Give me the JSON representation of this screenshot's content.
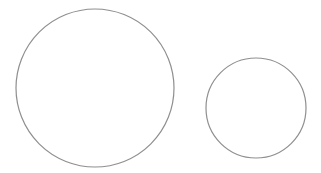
{
  "diagram": {
    "stroke_color": "#8f8f8f",
    "background_color": "#ffffff",
    "shapes": [
      {
        "id": "large-circle",
        "kind": "circle"
      },
      {
        "id": "small-circle",
        "kind": "circle"
      }
    ]
  }
}
